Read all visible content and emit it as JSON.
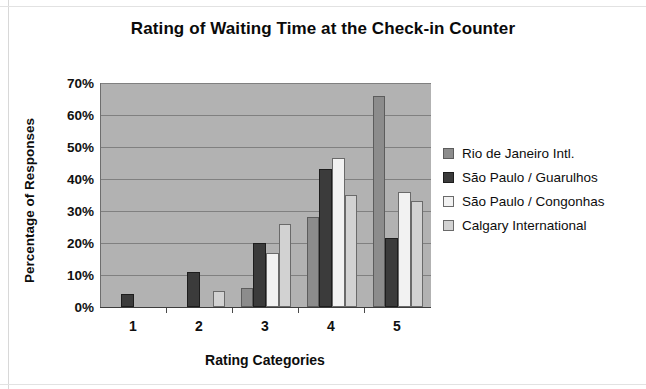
{
  "chart_data": {
    "type": "bar",
    "title": "Rating of Waiting Time at the Check-in Counter",
    "xlabel": "Rating Categories",
    "ylabel": "Percentage of Responses",
    "categories": [
      "1",
      "2",
      "3",
      "4",
      "5"
    ],
    "ylim": [
      0,
      70
    ],
    "ytick_labels": [
      "0%",
      "10%",
      "20%",
      "30%",
      "40%",
      "50%",
      "60%",
      "70%"
    ],
    "ytick_values": [
      0,
      10,
      20,
      30,
      40,
      50,
      60,
      70
    ],
    "grid": true,
    "legend_position": "right",
    "plot_background": "#b2b2b2",
    "series": [
      {
        "name": "Rio de Janeiro Intl.",
        "color": "#8c8c8c",
        "values": [
          0,
          0,
          6,
          28,
          66
        ]
      },
      {
        "name": "São Paulo / Guarulhos",
        "color": "#3b3b3b",
        "values": [
          4,
          11,
          20,
          43,
          21.5
        ]
      },
      {
        "name": "São Paulo / Congonhas",
        "color": "#f2f2f2",
        "values": [
          0,
          0,
          17,
          46.5,
          36
        ]
      },
      {
        "name": "Calgary International",
        "color": "#d2d2d2",
        "values": [
          0,
          5,
          26,
          35,
          33
        ]
      }
    ]
  }
}
